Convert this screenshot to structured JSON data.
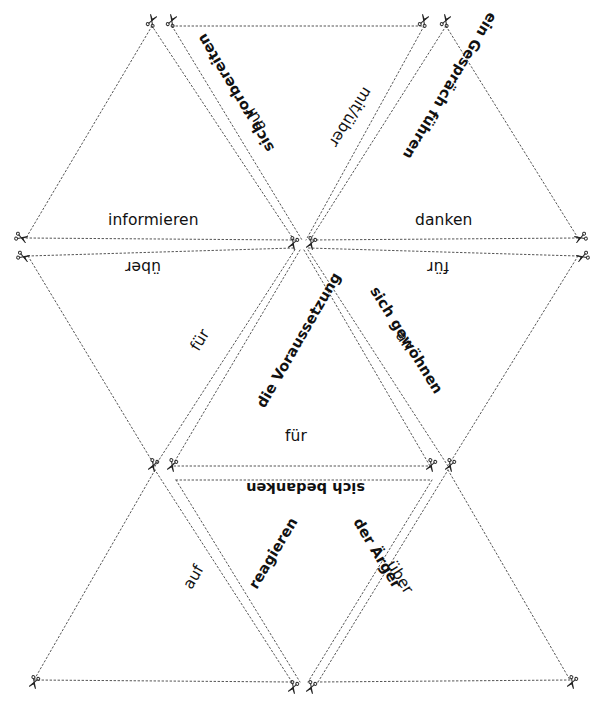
{
  "worksheet": {
    "type": "cut-out-triangle-puzzle",
    "language": "de",
    "ink_color": "#111111",
    "line_color": "#555555",
    "background": "#ffffff",
    "cut_marker_icon": "scissors-icon",
    "cut_marker_count": 18
  },
  "labels": {
    "informieren": "informieren",
    "ueber_left": "über",
    "danken": "danken",
    "fuer_right": "für",
    "sich_vorbereiten": "sich vorbereiten",
    "auf_top_left": "auf",
    "mit_ueber": "mit/über",
    "ein_gespraech_fuehren": "ein Gespräch führen",
    "fuer_mid_left": "für",
    "die_voraussetzung": "die Voraussetzung",
    "sich_gewoehnen": "sich gewöhnen",
    "an_mid_right": "an",
    "fuer_center": "für",
    "sich_bedanken": "sich bedanken",
    "auf_bottom_left": "auf",
    "reagieren": "reagieren",
    "der_aerger": "der Ärger",
    "ueber_bottom_right": "über"
  },
  "pairs": [
    {
      "verb": "informieren",
      "preposition": "über"
    },
    {
      "verb": "danken",
      "preposition": "für"
    },
    {
      "verb": "sich vorbereiten",
      "preposition": "auf"
    },
    {
      "verb": "ein Gespräch führen",
      "preposition": "mit/über"
    },
    {
      "verb": "die Voraussetzung",
      "preposition": "für"
    },
    {
      "verb": "sich gewöhnen",
      "preposition": "an"
    },
    {
      "verb": "sich bedanken",
      "preposition": "für"
    },
    {
      "verb": "reagieren",
      "preposition": "auf"
    },
    {
      "verb": "der Ärger",
      "preposition": "über"
    }
  ]
}
